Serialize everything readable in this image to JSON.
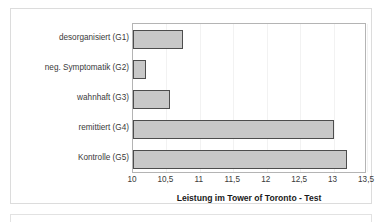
{
  "chart_data": {
    "type": "bar",
    "orientation": "horizontal",
    "title": "",
    "xlabel": "Leistung im Tower of Toronto - Test",
    "ylabel": "",
    "xlim": [
      10,
      13.5
    ],
    "grid": true,
    "legend": false,
    "categories": [
      "desorganisiert (G1)",
      "neg. Symptomatik (G2)",
      "wahnhaft (G3)",
      "remittiert (G4)",
      "Kontrolle (G5)"
    ],
    "values": [
      10.75,
      10.2,
      10.55,
      13.0,
      13.2
    ],
    "tick_labels": [
      "10",
      "10,5",
      "11",
      "11,5",
      "12",
      "12,5",
      "13",
      "13,5"
    ],
    "tick_values": [
      10,
      10.5,
      11,
      11.5,
      12,
      12.5,
      13,
      13.5
    ],
    "colors": {
      "bar_fill": "#c8c8c8",
      "bar_border": "#4d4d4d",
      "plot_border": "#b4b4b4",
      "gridline": "#f2f2f2",
      "text": "#3a3a3a",
      "title_text": "#1a1a1a",
      "frame": "#dcdcdc",
      "background": "#ffffff"
    }
  }
}
